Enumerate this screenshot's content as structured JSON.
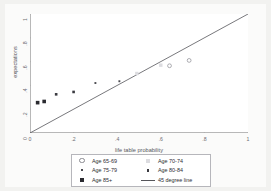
{
  "chart_data": {
    "type": "scatter",
    "title": "",
    "xlabel": "life table probability",
    "ylabel": "expectations",
    "xlim": [
      0,
      1
    ],
    "ylim": [
      0,
      1
    ],
    "xticks": [
      "0",
      ".2",
      ".4",
      ".6",
      ".8",
      "1"
    ],
    "xtick_values": [
      0,
      0.2,
      0.4,
      0.6,
      0.8,
      1
    ],
    "yticks": [
      "0",
      ".2",
      ".4",
      ".6",
      ".8",
      "1"
    ],
    "ytick_values": [
      0,
      0.2,
      0.4,
      0.6,
      0.8,
      1
    ],
    "grid": false,
    "legend_position": "bottom",
    "series": [
      {
        "name": "Age 65-69",
        "marker": "open-circle",
        "color": "#8a8a90",
        "points": [
          {
            "x": 0.73,
            "y": 0.61
          },
          {
            "x": 0.64,
            "y": 0.565
          }
        ]
      },
      {
        "name": "Age 70-74",
        "marker": "light-square",
        "color": "#dcdce0",
        "points": [
          {
            "x": 0.49,
            "y": 0.5
          },
          {
            "x": 0.6,
            "y": 0.57
          }
        ]
      },
      {
        "name": "Age 75-79",
        "marker": "dot",
        "color": "#4a4a50",
        "points": [
          {
            "x": 0.3,
            "y": 0.42
          },
          {
            "x": 0.41,
            "y": 0.435
          }
        ]
      },
      {
        "name": "Age 80-84",
        "marker": "small-square",
        "color": "#3a3a40",
        "points": [
          {
            "x": 0.12,
            "y": 0.325
          },
          {
            "x": 0.2,
            "y": 0.345
          }
        ]
      },
      {
        "name": "Age 85+",
        "marker": "big-square",
        "color": "#2a2a30",
        "points": [
          {
            "x": 0.035,
            "y": 0.255
          },
          {
            "x": 0.065,
            "y": 0.265
          }
        ]
      }
    ],
    "reference_line": {
      "name": "45 degree line",
      "from": {
        "x": 0,
        "y": 0
      },
      "to": {
        "x": 1,
        "y": 1
      },
      "color": "#55555a"
    },
    "legend": [
      {
        "label": "Age 65-69",
        "marker": "open-circle"
      },
      {
        "label": "Age 70-74",
        "marker": "light-square"
      },
      {
        "label": "Age 75-79",
        "marker": "dot"
      },
      {
        "label": "Age 80-84",
        "marker": "small-square"
      },
      {
        "label": "Age 85+",
        "marker": "big-square"
      },
      {
        "label": "45 degree line",
        "marker": "line"
      }
    ]
  },
  "colors": {
    "background": "#f2f2f0",
    "canvas": "#fbfbfa",
    "plot": "#ffffff",
    "axis": "#9a9a9a",
    "text": "#55555a"
  }
}
